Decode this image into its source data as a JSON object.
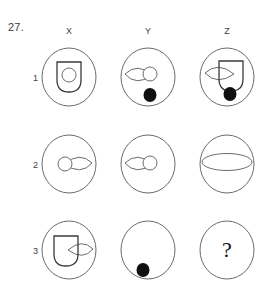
{
  "question": {
    "number": "27.",
    "missing_marker": "?"
  },
  "columns": [
    {
      "label": "X"
    },
    {
      "label": "Y"
    },
    {
      "label": "Z"
    }
  ],
  "rows": [
    {
      "label": "1"
    },
    {
      "label": "2"
    },
    {
      "label": "3"
    }
  ],
  "colors": {
    "outline": "#6b6b6b",
    "shape_outline": "#3a3a3a",
    "filled_dot": "#101010",
    "background": "#ffffff",
    "text": "#2b2b2b"
  },
  "matrix": [
    {
      "row": "1",
      "cells": [
        {
          "column": "X",
          "description": "large oval containing a shield with a small open circle inside",
          "elements": [
            "oval-frame",
            "shield",
            "small-circle"
          ]
        },
        {
          "column": "Y",
          "description": "large oval containing a left-pointing lens ellipse, a small open circle and a filled black dot",
          "elements": [
            "oval-frame",
            "lens-left",
            "small-circle",
            "black-dot"
          ]
        },
        {
          "column": "Z",
          "description": "large oval containing a shield overlapping a lens ellipse with a filled black dot below",
          "elements": [
            "oval-frame",
            "lens-left",
            "shield",
            "black-dot"
          ]
        }
      ]
    },
    {
      "row": "2",
      "cells": [
        {
          "column": "X",
          "description": "large oval containing a small open circle at left with a lens ellipse pointing right",
          "elements": [
            "oval-frame",
            "small-circle",
            "lens-right"
          ]
        },
        {
          "column": "Y",
          "description": "large oval containing a lens ellipse pointing left with a small open circle at its right",
          "elements": [
            "oval-frame",
            "lens-left",
            "small-circle"
          ]
        },
        {
          "column": "Z",
          "description": "large oval containing a wide flat horizontal ellipse",
          "elements": [
            "oval-frame",
            "wide-ellipse"
          ]
        }
      ]
    },
    {
      "row": "3",
      "cells": [
        {
          "column": "X",
          "description": "large oval containing a shield at left with a lens ellipse handle at right",
          "elements": [
            "oval-frame",
            "shield",
            "lens-right"
          ]
        },
        {
          "column": "Y",
          "description": "large oval containing only a filled black dot near the bottom",
          "elements": [
            "oval-frame",
            "black-dot"
          ]
        },
        {
          "column": "Z",
          "description": "large oval containing a question mark marking the missing figure",
          "elements": [
            "oval-frame",
            "question-mark"
          ]
        }
      ]
    }
  ]
}
